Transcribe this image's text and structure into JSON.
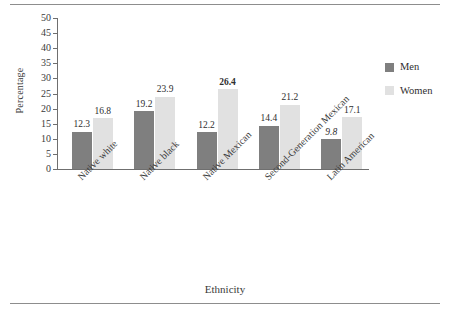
{
  "chart_data": {
    "type": "bar",
    "title": "",
    "xlabel": "Ethnicity",
    "ylabel": "Percentage",
    "ylim": [
      0,
      50
    ],
    "yticks": [
      0,
      5,
      10,
      15,
      20,
      25,
      30,
      35,
      40,
      45,
      50
    ],
    "grid": false,
    "legend_position": "right",
    "categories": [
      "Native white",
      "Native black",
      "Native Mexican",
      "Second-Generation Mexican",
      "Latin American"
    ],
    "series": [
      {
        "name": "Men",
        "color": "#7f7f7f",
        "values": [
          12.3,
          19.2,
          12.2,
          14.4,
          9.8
        ],
        "label_styles": [
          "normal",
          "normal",
          "normal",
          "normal",
          "italic"
        ]
      },
      {
        "name": "Women",
        "color": "#e1e1e1",
        "values": [
          16.8,
          23.9,
          26.4,
          21.2,
          17.1
        ],
        "label_styles": [
          "normal",
          "normal",
          "bold",
          "normal",
          "normal"
        ]
      }
    ]
  },
  "legend": {
    "items": [
      {
        "label": "Men"
      },
      {
        "label": "Women"
      }
    ]
  },
  "axes": {
    "y_title": "Percentage",
    "x_title": "Ethnicity"
  }
}
